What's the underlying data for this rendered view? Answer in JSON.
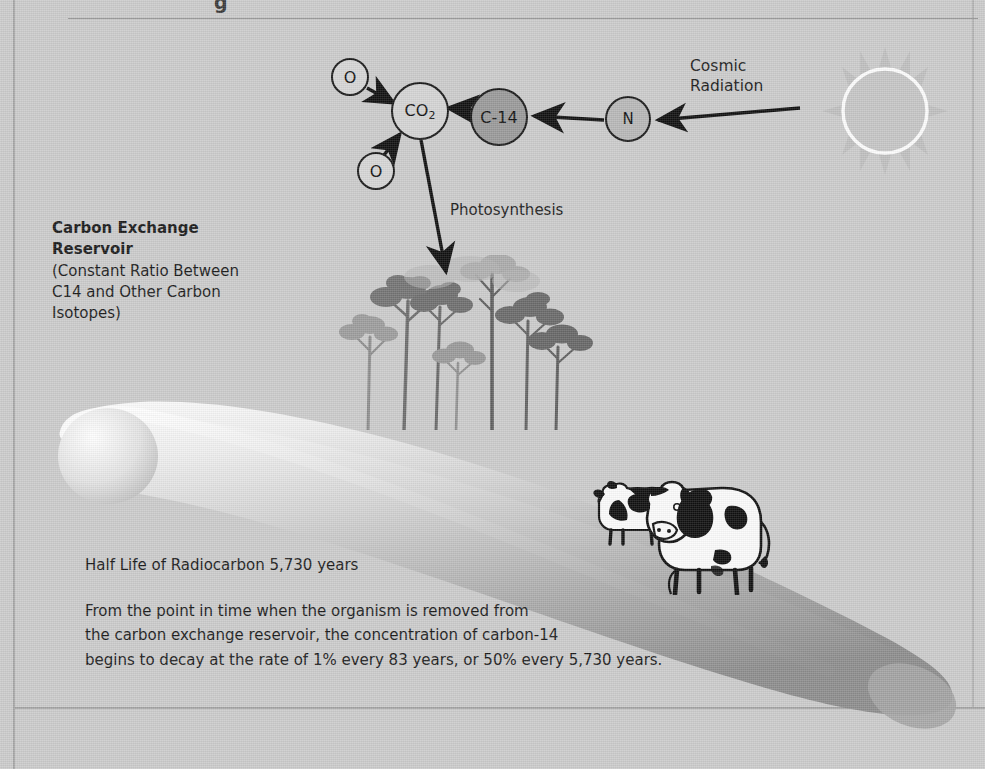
{
  "figure": {
    "background_color": "#cccccc",
    "title_fragment": "g"
  },
  "diagram": {
    "nodes": [
      {
        "id": "o-top",
        "label": "O",
        "shade": "#d6d6d6"
      },
      {
        "id": "o-bottom",
        "label": "O",
        "shade": "#d6d6d6"
      },
      {
        "id": "co2",
        "label": "CO",
        "subscript": "2",
        "shade": "#d4d4d4"
      },
      {
        "id": "c14",
        "label": "C-14",
        "shade": "#9a9a9a"
      },
      {
        "id": "n",
        "label": "N",
        "shade": "#b8b8b8"
      }
    ],
    "cosmic_radiation_label": "Cosmic\nRadiation",
    "cosmic_radiation_line1": "Cosmic",
    "cosmic_radiation_line2": "Radiation",
    "photosynthesis_label": "Photosynthesis"
  },
  "reservoir": {
    "heading_line1": "Carbon Exchange",
    "heading_line2": "Reservoir",
    "detail_line1": "(Constant Ratio Between",
    "detail_line2": "C14 and Other Carbon",
    "detail_line3": "Isotopes)"
  },
  "facts": {
    "half_life": "Half Life of Radiocarbon 5,730 years",
    "paragraph_line1": "From the point in time when the organism is removed from",
    "paragraph_line2": "the carbon exchange reservoir, the concentration of carbon-14",
    "paragraph_line3": "begins to decay at the rate of 1% every 83 years, or 50% every 5,730 years."
  },
  "scene": {
    "sun": "sun-icon",
    "trees": "tree-icons",
    "cows": "cow-icons",
    "landform": "hill-shape"
  }
}
